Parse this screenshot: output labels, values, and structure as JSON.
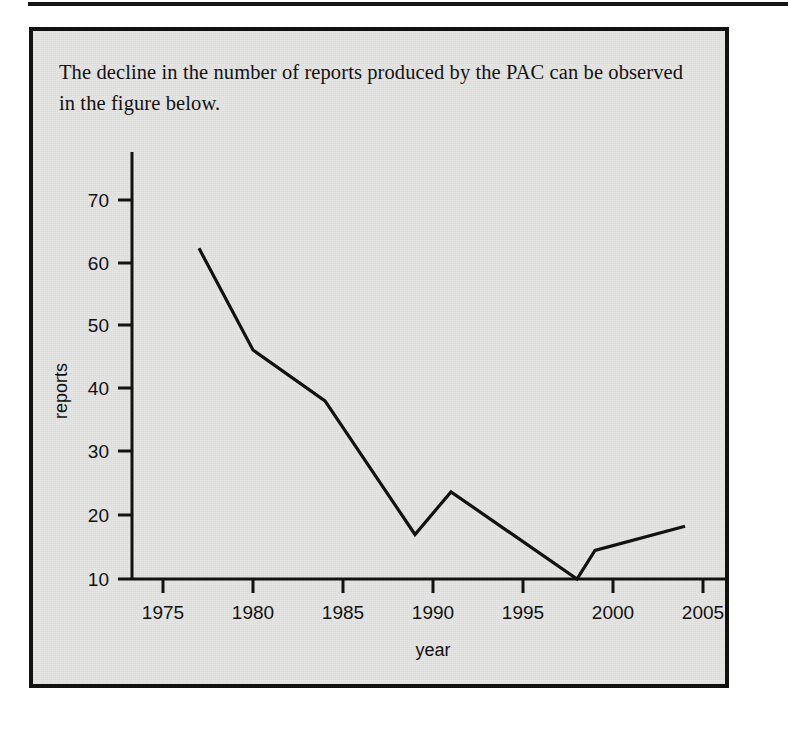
{
  "page": {
    "caption": "The decline in the number of reports produced by the PAC can be observed in the figure below."
  },
  "chart_data": {
    "type": "line",
    "title": "",
    "xlabel": "year",
    "ylabel": "reports",
    "xlim": [
      1973,
      2006.5
    ],
    "ylim": [
      10,
      74
    ],
    "xticks": [
      1975,
      1980,
      1985,
      1990,
      1995,
      2000,
      2005
    ],
    "xtick_labels": [
      "1975",
      "1980",
      "1985",
      "1990",
      "1995",
      "2000",
      "2005"
    ],
    "yticks": [
      10,
      20,
      30,
      40,
      50,
      60,
      70
    ],
    "ytick_labels": [
      "10",
      "20",
      "30",
      "40",
      "50",
      "60",
      "70"
    ],
    "grid": false,
    "legend": null,
    "series": [
      {
        "name": "reports",
        "color": "#121212",
        "x": [
          1977,
          1980,
          1984,
          1989,
          1991,
          1998,
          1999,
          2004
        ],
        "y": [
          62,
          46,
          38,
          17,
          23.7,
          10,
          14.5,
          18.3
        ]
      }
    ]
  }
}
